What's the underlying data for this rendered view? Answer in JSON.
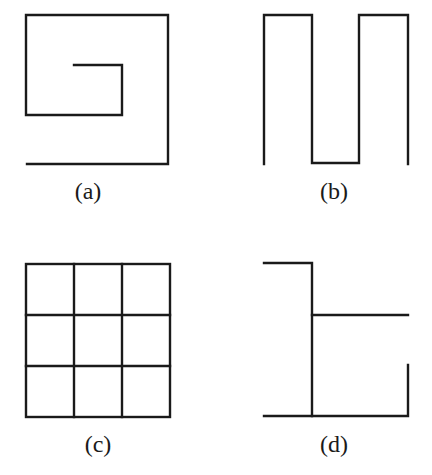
{
  "figure": {
    "panels": [
      {
        "id": "a",
        "label": "(a)",
        "shape": "spiral",
        "polyline": [
          [
            27,
            164
          ],
          [
            168,
            164
          ],
          [
            168,
            15
          ],
          [
            26,
            15
          ],
          [
            26,
            115
          ],
          [
            122,
            115
          ],
          [
            122,
            65
          ],
          [
            74,
            65
          ]
        ]
      },
      {
        "id": "b",
        "label": "(b)",
        "shape": "meander",
        "polyline": [
          [
            264,
            164
          ],
          [
            264,
            15
          ],
          [
            312,
            15
          ],
          [
            312,
            163
          ],
          [
            359,
            163
          ],
          [
            359,
            15
          ],
          [
            408,
            15
          ],
          [
            408,
            164
          ]
        ]
      },
      {
        "id": "c",
        "label": "(c)",
        "shape": "3x3-grid",
        "grid": {
          "x": [
            26,
            74,
            122,
            170
          ],
          "y": [
            264,
            315,
            366,
            417
          ]
        }
      },
      {
        "id": "d",
        "label": "(d)",
        "shape": "branching-lines",
        "segments": [
          [
            [
              264,
              263
            ],
            [
              312,
              263
            ],
            [
              312,
              416
            ]
          ],
          [
            [
              312,
              315
            ],
            [
              408,
              315
            ]
          ],
          [
            [
              264,
              416
            ],
            [
              408,
              416
            ],
            [
              408,
              365
            ]
          ]
        ]
      }
    ]
  }
}
